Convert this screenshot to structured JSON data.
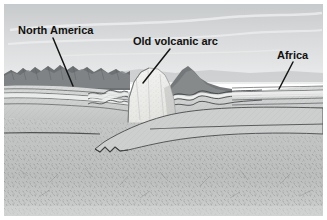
{
  "figure": {
    "type": "geologic-cross-section",
    "width": 327,
    "height": 220,
    "background_color": "#ffffff",
    "border_color": "#ffffff"
  },
  "labels": [
    {
      "id": "north-america",
      "text": "North America",
      "x": 18,
      "y": 34,
      "font_size": 11,
      "color": "#111111",
      "leader": {
        "x1": 53,
        "y1": 38,
        "x2": 73,
        "y2": 86
      }
    },
    {
      "id": "old-volcanic-arc",
      "text": "Old volcanic arc",
      "x": 133,
      "y": 45,
      "font_size": 11,
      "color": "#111111",
      "leader": {
        "x1": 170,
        "y1": 49,
        "x2": 143,
        "y2": 83
      }
    },
    {
      "id": "africa",
      "text": "Africa",
      "x": 277,
      "y": 59,
      "font_size": 11,
      "color": "#111111",
      "leader": {
        "x1": 293,
        "y1": 62,
        "x2": 279,
        "y2": 89
      }
    }
  ],
  "colors": {
    "sky_top": "#cfd2d4",
    "sky_bottom": "#e6e7e8",
    "cloud": "#f2f3f3",
    "mountain_dark": "#6b6e70",
    "mountain_mid": "#8a8d8f",
    "strata_light": "#e9eaea",
    "strata_mid": "#c4c6c7",
    "strata_line": "#4a4c4d",
    "volcanic_arc": "#f0f0ee",
    "crust_body": "#c9cbcb",
    "mantle": "#c2c4c4",
    "slab_line": "#4e5051",
    "leader_line": "#141414"
  },
  "regions": [
    {
      "id": "sky",
      "label": "sky",
      "y_range": [
        4,
        72
      ]
    },
    {
      "id": "north-america-range",
      "label": "North America mountain range",
      "x_range": [
        4,
        128
      ]
    },
    {
      "id": "volcanic-arc-block",
      "label": "Old volcanic arc block",
      "x_range": [
        126,
        176
      ]
    },
    {
      "id": "folded-strata",
      "label": "folded strata belt",
      "x_range": [
        170,
        232
      ]
    },
    {
      "id": "africa-platform",
      "label": "Africa layered platform",
      "x_range": [
        230,
        323
      ]
    },
    {
      "id": "subducting-slab",
      "label": "subducting slab with serrated tip",
      "x_range": [
        90,
        250
      ]
    },
    {
      "id": "mantle",
      "label": "mantle",
      "y_range": [
        150,
        216
      ]
    }
  ]
}
